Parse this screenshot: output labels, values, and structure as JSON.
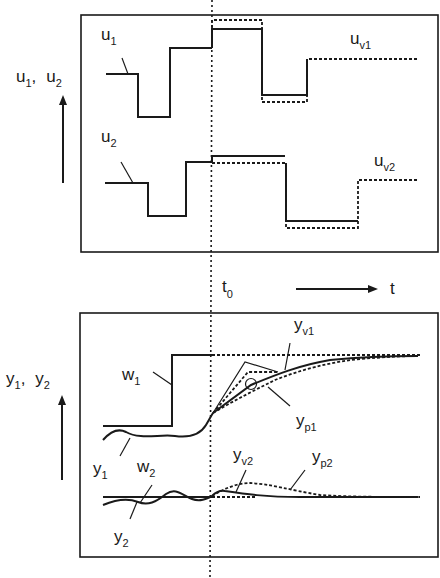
{
  "diagram": {
    "top_panel": {
      "axis_label": {
        "main1": "u",
        "sub1": "1",
        "sep": ",",
        "main2": "u",
        "sub2": "2"
      },
      "signals": [
        {
          "id": "u1",
          "main": "u",
          "sub": "1",
          "type": "past input (solid)"
        },
        {
          "id": "uv1",
          "main": "u",
          "sub": "v1",
          "type": "future input variants (dashed)"
        },
        {
          "id": "u2",
          "main": "u",
          "sub": "2",
          "type": "past input (solid)"
        },
        {
          "id": "uv2",
          "main": "u",
          "sub": "v2",
          "type": "future input variants (dashed)"
        }
      ]
    },
    "time_axis": {
      "t0_main": "t",
      "t0_sub": "0",
      "t_label": "t"
    },
    "bottom_panel": {
      "axis_label": {
        "main1": "y",
        "sub1": "1",
        "sep": ",",
        "main2": "y",
        "sub2": "2"
      },
      "signals": [
        {
          "id": "w1",
          "main": "w",
          "sub": "1",
          "type": "setpoint step"
        },
        {
          "id": "y1",
          "main": "y",
          "sub": "1",
          "type": "measured output (past)"
        },
        {
          "id": "yv1",
          "main": "y",
          "sub": "v1",
          "type": "predicted output variants"
        },
        {
          "id": "yp1",
          "main": "y",
          "sub": "p1",
          "type": "prediction (dashed)"
        },
        {
          "id": "w2",
          "main": "w",
          "sub": "2",
          "type": "setpoint constant"
        },
        {
          "id": "y2",
          "main": "y",
          "sub": "2",
          "type": "measured output (past)"
        },
        {
          "id": "yv2",
          "main": "y",
          "sub": "v2",
          "type": "predicted output"
        },
        {
          "id": "yp2",
          "main": "y",
          "sub": "p2",
          "type": "prediction (dashed)"
        }
      ]
    },
    "colors": {
      "ink": "#1a1a1a",
      "background": "#ffffff"
    }
  }
}
